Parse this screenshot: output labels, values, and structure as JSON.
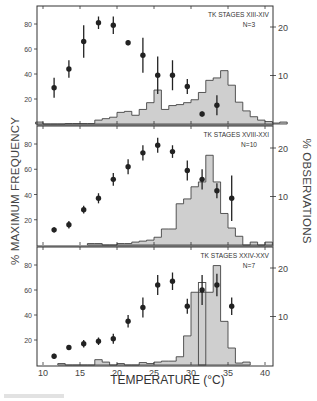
{
  "figure": {
    "y_label_left": "% MAXIMUM FREQUENCY",
    "y_label_right": "% OBSERVATIONS",
    "x_label": "TEMPERATURE (°C)"
  },
  "colors": {
    "frame": "#333333",
    "histogram_fill": "#cfcfcf",
    "histogram_edge": "#444444",
    "point": "#222222"
  },
  "chart_data": [
    {
      "type": "bar+scatter",
      "title": "TK STAGES XIII-XIV",
      "subtitle": "N=3",
      "xlabel": "TEMPERATURE (°C)",
      "ylabel": "% MAXIMUM FREQUENCY",
      "ylabel_right": "% OBSERVATIONS",
      "xlim": [
        9.2,
        41
      ],
      "ylim_left": [
        0,
        100
      ],
      "ylim_right": [
        0,
        24
      ],
      "x_ticks": [
        10,
        15,
        20,
        25,
        30,
        35,
        40
      ],
      "y_ticks_left": [
        20,
        40,
        60,
        80
      ],
      "y_ticks_right": [
        10,
        20
      ],
      "histogram": {
        "name": "% observations",
        "bin_edges": [
          9,
          10,
          11,
          12,
          13,
          14,
          15,
          16,
          17,
          18,
          19,
          20,
          21,
          22,
          23,
          24,
          25,
          26,
          27,
          28,
          29,
          30,
          31,
          32,
          33,
          34,
          35,
          36,
          37,
          38
        ],
        "values": [
          0.4,
          0,
          0,
          0,
          0.1,
          0.1,
          0.1,
          0.1,
          0.8,
          1.1,
          1.4,
          2.4,
          2.6,
          1.8,
          3.0,
          4.4,
          7.0,
          3.0,
          3.8,
          4.0,
          4.4,
          5.0,
          6.5,
          9.0,
          9.5,
          11.0,
          8.0,
          4.5,
          2.7,
          1.5,
          0.8,
          0.5,
          0.2,
          0.4
        ]
      },
      "points": {
        "name": "% maximum frequency",
        "x": [
          11.5,
          13.5,
          15.5,
          17.5,
          19.5,
          21.5,
          23.5,
          25.5,
          27.5,
          29.5,
          31.5,
          33.5
        ],
        "y": [
          29,
          44,
          66,
          81,
          79,
          65,
          55,
          39,
          39,
          30,
          8,
          15
        ],
        "err": [
          8,
          7,
          13,
          5,
          7,
          2,
          14,
          15,
          12,
          6,
          2,
          8
        ]
      }
    },
    {
      "type": "bar+scatter",
      "title": "TK STAGES XVIII-XXI",
      "subtitle": "N=10",
      "xlabel": "TEMPERATURE (°C)",
      "ylabel": "% MAXIMUM FREQUENCY",
      "ylabel_right": "% OBSERVATIONS",
      "xlim": [
        9.2,
        41
      ],
      "ylim_left": [
        0,
        100
      ],
      "ylim_right": [
        0,
        24
      ],
      "x_ticks": [
        10,
        15,
        20,
        25,
        30,
        35,
        40
      ],
      "y_ticks_left": [
        20,
        40,
        60,
        80
      ],
      "y_ticks_right": [
        10,
        20
      ],
      "histogram": {
        "name": "% observations",
        "bin_edges": [
          16,
          17,
          18,
          19,
          20,
          21,
          22,
          23,
          24,
          25,
          26,
          27,
          28,
          29,
          30,
          31,
          32,
          33,
          34,
          35,
          36,
          37,
          38,
          39,
          40
        ],
        "values": [
          0.3,
          0.3,
          0,
          0,
          0.3,
          0.3,
          0.6,
          0.8,
          1.0,
          1.6,
          3.3,
          3.3,
          8.5,
          9.5,
          12.0,
          13.0,
          18.5,
          13.0,
          6.5,
          3.5,
          1.8,
          0,
          0.6,
          0,
          0.6
        ]
      },
      "points": {
        "name": "% maximum frequency",
        "x": [
          11.5,
          13.5,
          15.5,
          17.5,
          19.5,
          21.5,
          23.5,
          25.5,
          27.5,
          29.5,
          31.5,
          33.5,
          35.5
        ],
        "y": [
          12,
          16,
          28,
          37,
          52,
          62,
          73,
          79,
          74,
          59,
          52,
          43,
          37
        ],
        "err": [
          2,
          3,
          3,
          4,
          5,
          6,
          6,
          6,
          5,
          8,
          8,
          6,
          18
        ]
      }
    },
    {
      "type": "bar+scatter",
      "title": "TK STAGES XXIV-XXV",
      "subtitle": "N=7",
      "xlabel": "TEMPERATURE (°C)",
      "ylabel": "% MAXIMUM FREQUENCY",
      "ylabel_right": "% OBSERVATIONS",
      "xlim": [
        9.2,
        41
      ],
      "ylim_left": [
        0,
        100
      ],
      "ylim_right": [
        0,
        24
      ],
      "x_ticks": [
        10,
        15,
        20,
        25,
        30,
        35,
        40
      ],
      "y_ticks_left": [
        20,
        40,
        60,
        80
      ],
      "y_ticks_right": [
        10,
        20
      ],
      "histogram": {
        "name": "% observations",
        "bin_edges": [
          12,
          13,
          14,
          15,
          16,
          17,
          18,
          19,
          20,
          21,
          22,
          23,
          24,
          25,
          26,
          27,
          28,
          29,
          30,
          31,
          32,
          33,
          34,
          35,
          36,
          37,
          38
        ],
        "values": [
          0.3,
          0,
          0,
          0,
          0,
          1.1,
          0.6,
          0,
          0.3,
          0,
          0,
          0.5,
          0.3,
          0.6,
          0.8,
          0.8,
          1.7,
          6.0,
          15.0,
          15.0,
          15.0,
          20.5,
          9.0,
          3.5,
          0.4,
          0.6
        ],
        "overlay_bar": {
          "x0": 31,
          "x1": 32,
          "value": 17
        }
      },
      "points": {
        "name": "% maximum frequency",
        "x": [
          11.5,
          13.5,
          15.5,
          17.5,
          19.5,
          21.5,
          23.5,
          25.5,
          27.5,
          29.5,
          31.5,
          33.5,
          35.5
        ],
        "y": [
          7,
          14,
          17,
          19,
          21,
          35,
          46,
          64,
          67,
          47,
          60,
          64,
          47
        ],
        "err": [
          2,
          2,
          3,
          3,
          4,
          5,
          8,
          8,
          7,
          6,
          12,
          9,
          7
        ]
      }
    }
  ]
}
